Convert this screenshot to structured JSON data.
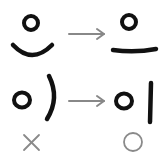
{
  "rows": [
    {
      "wrong_char": "으",
      "right_char": "으",
      "arrow": "right-arrow"
    },
    {
      "wrong_char": "이",
      "right_char": "이",
      "arrow": "right-arrow"
    }
  ],
  "marks": {
    "wrong": "×",
    "right": "○"
  },
  "colors": {
    "ink": "#111111",
    "arrow": "#888888",
    "mark": "#8a8a8a",
    "background": "#ffffff"
  }
}
